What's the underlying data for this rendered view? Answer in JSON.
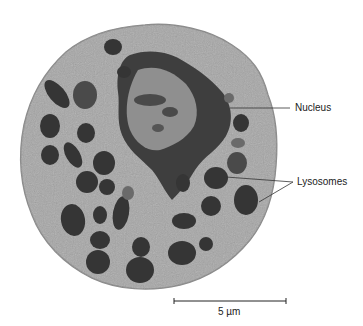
{
  "figure": {
    "labels": {
      "nucleus": "Nucleus",
      "lysosomes": "Lysosomes"
    },
    "scale_bar": {
      "label": "5 µm"
    },
    "colors": {
      "background": "#ffffff",
      "cytoplasm": "#a4a4a4",
      "dark_organelle": "#3a3a3a",
      "nucleus_light": "#9a9a9a",
      "line": "#333333"
    }
  }
}
